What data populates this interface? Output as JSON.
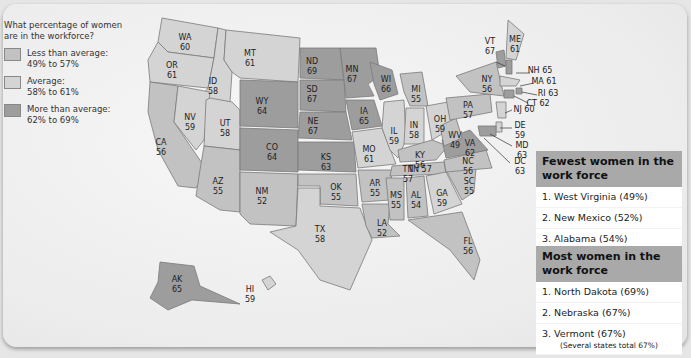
{
  "legend": {
    "question": "What percentage of women are in the workforce?",
    "items": [
      {
        "label": "Less than average:",
        "range": "49% to 57%",
        "color": "#c2c2c2"
      },
      {
        "label": "Average:",
        "range": "58% to 61%",
        "color": "#d4d4d4"
      },
      {
        "label": "More than average:",
        "range": "62% to 69%",
        "color": "#9d9d9d"
      }
    ]
  },
  "states": {
    "WA": "60",
    "OR": "61",
    "CA": "56",
    "ID": "58",
    "NV": "59",
    "UT": "58",
    "AZ": "55",
    "MT": "61",
    "WY": "64",
    "CO": "64",
    "NM": "52",
    "ND": "69",
    "SD": "67",
    "NE": "67",
    "KS": "63",
    "OK": "55",
    "TX": "58",
    "MN": "67",
    "IA": "65",
    "MO": "61",
    "AR": "55",
    "LA": "52",
    "WI": "66",
    "IL": "59",
    "MI": "55",
    "IN": "58",
    "OH": "59",
    "KY": "56",
    "TN": "57",
    "MS": "55",
    "AL": "54",
    "GA": "59",
    "FL": "56",
    "SC": "55",
    "NC": "56",
    "VA": "62",
    "WV": "49",
    "PA": "57",
    "NY": "56",
    "VT": "67",
    "ME": "61",
    "NH": "65",
    "MA": "61",
    "RI": "63",
    "CT": "62",
    "NJ": "60",
    "DE": "59",
    "MD": "63",
    "DC": "63",
    "AK": "65",
    "HI": "59"
  },
  "fewest": {
    "title": "Fewest women in the work force",
    "items": [
      "1. West Virginia (49%)",
      "2. New Mexico (52%)",
      "3. Alabama (54%)"
    ]
  },
  "most": {
    "title": "Most women in the work force",
    "items": [
      "1. North Dakota (69%)",
      "2. Nebraska (67%)",
      "3. Vermont  (67%)"
    ],
    "note": "(Several states total 67%)"
  }
}
